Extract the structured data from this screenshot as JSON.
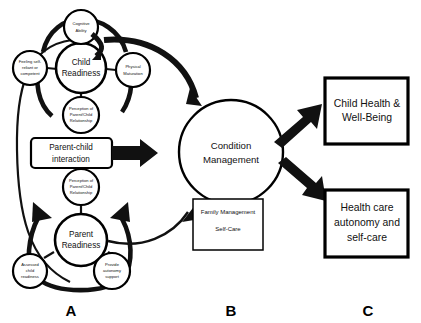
{
  "figure": {
    "background_color": "#ffffff",
    "line_color": "#111111"
  },
  "sections": [
    {
      "id": "A",
      "label": "A",
      "x": 71,
      "y": 313
    },
    {
      "id": "B",
      "label": "B",
      "x": 231,
      "y": 313
    },
    {
      "id": "C",
      "label": "C",
      "x": 368,
      "y": 313
    }
  ],
  "child_readiness": {
    "center_label_line1": "Child",
    "center_label_line2": "Readiness",
    "satellites": {
      "top": {
        "line1": "Cognitive",
        "line2": "Ability"
      },
      "left": {
        "line1": "Feeling self-",
        "line2": "reliant or",
        "line3": "competent"
      },
      "right": {
        "line1": "Physical",
        "line2": "Maturation"
      },
      "bottom": {
        "line1": "Perception of",
        "line2": "Parent/Child",
        "line3": "Relationship"
      }
    }
  },
  "parent_readiness": {
    "center_label_line1": "Parent",
    "center_label_line2": "Readiness",
    "satellites": {
      "top": {
        "line1": "Perception of",
        "line2": "Parent/Child",
        "line3": "Relationship"
      },
      "left": {
        "line1": "Assessed",
        "line2": "child",
        "line3": "readiness"
      },
      "right": {
        "line1": "Provide",
        "line2": "autonomy",
        "line3": "support"
      }
    }
  },
  "interaction_box": {
    "line1": "Parent-child",
    "line2": "interaction"
  },
  "condition_management": {
    "line1": "Condition",
    "line2": "Management",
    "sub_box": {
      "line1": "Family Management",
      "line2": "Self-Care"
    }
  },
  "outcomes": [
    {
      "id": "child-health",
      "line1": "Child Health &",
      "line2": "Well-Being",
      "line3": ""
    },
    {
      "id": "healthcare-autonomy",
      "line1": "Health care",
      "line2": "autonomy and",
      "line3": "self-care"
    }
  ]
}
